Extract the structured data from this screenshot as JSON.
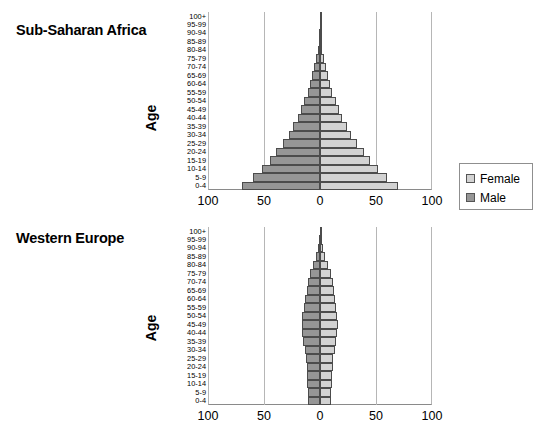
{
  "chart_data": [
    {
      "type": "bar",
      "title": "Sub-Saharan Africa",
      "subtype": "population-pyramid",
      "xlabel": "",
      "ylabel": "Age",
      "xlim": [
        -100,
        100
      ],
      "xticks": [
        100,
        50,
        0,
        50,
        100
      ],
      "grid": true,
      "legend_position": "right",
      "categories": [
        "0-4",
        "5-9",
        "10-14",
        "15-19",
        "20-24",
        "25-29",
        "30-34",
        "35-39",
        "40-44",
        "45-49",
        "50-54",
        "55-59",
        "60-64",
        "65-69",
        "70-74",
        "75-79",
        "80-84",
        "85-89",
        "90-94",
        "95-99",
        "100+"
      ],
      "series": [
        {
          "name": "Male",
          "values": [
            70,
            60,
            52,
            45,
            39,
            33,
            28,
            24,
            20,
            17,
            14,
            11,
            9,
            7,
            5,
            3.5,
            2.2,
            1.3,
            0.7,
            0.3,
            0.1
          ]
        },
        {
          "name": "Female",
          "values": [
            70,
            60,
            52,
            45,
            39,
            33,
            28,
            24,
            20,
            17,
            14,
            11,
            9,
            7,
            5,
            3.5,
            2.2,
            1.3,
            0.7,
            0.3,
            0.1
          ]
        }
      ]
    },
    {
      "type": "bar",
      "title": "Western Europe",
      "subtype": "population-pyramid",
      "xlabel": "",
      "ylabel": "Age",
      "xlim": [
        -100,
        100
      ],
      "xticks": [
        100,
        50,
        0,
        50,
        100
      ],
      "grid": true,
      "legend_position": "none",
      "categories": [
        "0-4",
        "5-9",
        "10-14",
        "15-19",
        "20-24",
        "25-29",
        "30-34",
        "35-39",
        "40-44",
        "45-49",
        "50-54",
        "55-59",
        "60-64",
        "65-69",
        "70-74",
        "75-79",
        "80-84",
        "85-89",
        "90-94",
        "95-99",
        "100+"
      ],
      "series": [
        {
          "name": "Male",
          "values": [
            10.5,
            10.5,
            11.5,
            11.5,
            12,
            12.5,
            13.5,
            15,
            16,
            16.5,
            16,
            14,
            13,
            12,
            10.5,
            8.5,
            6,
            3.5,
            1.7,
            0.6,
            0.15
          ]
        },
        {
          "name": "Female",
          "values": [
            10,
            10,
            11,
            11,
            11.5,
            12,
            13,
            14.5,
            15.5,
            16,
            15.5,
            14,
            13,
            12.5,
            11.5,
            10,
            7.5,
            4.8,
            2.4,
            0.9,
            0.2
          ]
        }
      ]
    }
  ],
  "charts": [
    {
      "id": "africa",
      "title": "Sub-Saharan Africa",
      "axis_label": "Age",
      "xticks": [
        "100",
        "50",
        "0",
        "50",
        "100"
      ]
    },
    {
      "id": "europe",
      "title": "Western Europe",
      "axis_label": "Age",
      "xticks": [
        "100",
        "50",
        "0",
        "50",
        "100"
      ]
    }
  ],
  "age_labels": [
    "100+",
    "95-99",
    "90-94",
    "85-89",
    "80-84",
    "75-79",
    "70-74",
    "65-69",
    "60-64",
    "55-59",
    "50-54",
    "45-49",
    "40-44",
    "35-39",
    "30-34",
    "25-29",
    "20-24",
    "15-19",
    "10-14",
    "5-9",
    "0-4"
  ],
  "legend": {
    "items": [
      {
        "label": "Female",
        "color": "#d2d2d2"
      },
      {
        "label": "Male",
        "color": "#969696"
      }
    ]
  },
  "colors": {
    "male": "#969696",
    "female": "#d2d2d2",
    "bar_border": "#4c4c4c",
    "gridline": "#b6b6b6",
    "axis": "#8a8a8a",
    "background": "#ffffff",
    "text": "#000000"
  }
}
